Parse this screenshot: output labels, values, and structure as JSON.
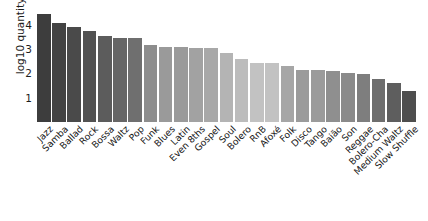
{
  "chart_data": {
    "type": "bar",
    "title": "",
    "xlabel": "",
    "ylabel": "log10 quantity",
    "ylim": [
      0,
      4.6
    ],
    "yticks": [
      1,
      2,
      3,
      4
    ],
    "grid": false,
    "legend": null,
    "categories": [
      "Jazz",
      "Samba",
      "Ballad",
      "Rock",
      "Bossa",
      "Waltz",
      "Pop",
      "Funk",
      "Blues",
      "Latin",
      "Even 8ths",
      "Gospel",
      "Soul",
      "Bolero",
      "RnB",
      "Afoxé",
      "Folk",
      "Disco",
      "Tango",
      "Baião",
      "Son",
      "Reggae",
      "Bolero-Cha",
      "Medium Waltz",
      "Slow Shuffle"
    ],
    "values": [
      4.42,
      4.08,
      3.9,
      3.74,
      3.53,
      3.46,
      3.46,
      3.18,
      3.1,
      3.1,
      3.05,
      3.02,
      2.85,
      2.6,
      2.44,
      2.43,
      2.3,
      2.15,
      2.15,
      2.1,
      2.03,
      1.97,
      1.76,
      1.6,
      1.28
    ],
    "bar_colors": [
      "#3d3d3d",
      "#434343",
      "#4a4a4a",
      "#525252",
      "#5c5c5c",
      "#666666",
      "#6f6f6f",
      "#8d8d8d",
      "#9a9a9a",
      "#9a9a9a",
      "#a2a2a2",
      "#a8a8a8",
      "#b4b4b4",
      "#bcbcbc",
      "#c2c2c2",
      "#c2c2c2",
      "#a6a6a6",
      "#9b9b9b",
      "#9b9b9b",
      "#8f8f8f",
      "#8a8a8a",
      "#7e7e7e",
      "#6e6e6e",
      "#5e5e5e",
      "#4e4e4e"
    ]
  }
}
